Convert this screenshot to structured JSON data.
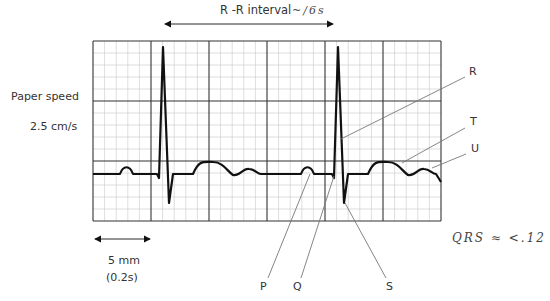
{
  "header": {
    "rr_label": "R -R interval",
    "rr_annotation": "~/6s"
  },
  "side": {
    "paper_speed_label": "Paper speed",
    "paper_speed_value": "2.5 cm/s"
  },
  "scale": {
    "distance": "5 mm",
    "time": "(0.2s)"
  },
  "wave_labels": {
    "R": "R",
    "T": "T",
    "U": "U",
    "P": "P",
    "Q": "Q",
    "S": "S"
  },
  "handwritten_note": "QRS ≈ <.12",
  "colors": {
    "grid_minor": "#c8c8c8",
    "grid_major": "#333333",
    "trace": "#111111",
    "leader": "#777777"
  }
}
